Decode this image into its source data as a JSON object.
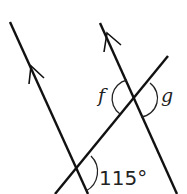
{
  "diagram": {
    "type": "parallel-lines-transversal",
    "labels": {
      "f": "f",
      "g": "g",
      "angle": "115°"
    },
    "colors": {
      "line": "#111111",
      "background": "#ffffff"
    }
  }
}
